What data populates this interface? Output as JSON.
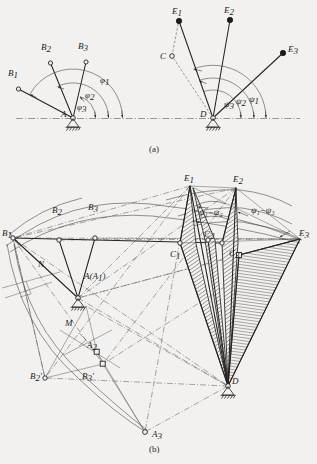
{
  "figure": {
    "panels": [
      {
        "id": "a",
        "caption": "(a)",
        "description": "Input crank AB and output crank DE angular positions"
      },
      {
        "id": "b",
        "caption": "(b)",
        "description": "Inversion construction with relative pole circles"
      }
    ]
  },
  "panel_a": {
    "caption": "(a)",
    "left_mechanism": {
      "pivot_label": "A",
      "points": [
        {
          "name": "B1",
          "label": "B",
          "sub": "1"
        },
        {
          "name": "B2",
          "label": "B",
          "sub": "2"
        },
        {
          "name": "B3",
          "label": "B",
          "sub": "3"
        }
      ],
      "angles": [
        {
          "name": "phi1",
          "label": "φ",
          "sub": "1"
        },
        {
          "name": "phi2",
          "label": "φ",
          "sub": "2"
        },
        {
          "name": "phi3",
          "label": "φ",
          "sub": "3"
        }
      ]
    },
    "right_mechanism": {
      "pivot_label": "D",
      "coupler_point_label": "C",
      "points": [
        {
          "name": "E1",
          "label": "E",
          "sub": "1"
        },
        {
          "name": "E2",
          "label": "E",
          "sub": "2"
        },
        {
          "name": "E3",
          "label": "E",
          "sub": "3"
        }
      ],
      "angles": [
        {
          "name": "psi1",
          "label": "ψ",
          "sub": "1"
        },
        {
          "name": "psi2",
          "label": "ψ",
          "sub": "2"
        },
        {
          "name": "psi3",
          "label": "ψ",
          "sub": "3"
        }
      ]
    }
  },
  "panel_b": {
    "caption": "(b)",
    "pivots": [
      {
        "name": "A",
        "label": "A(A",
        "sub": "1",
        "tail": ")"
      },
      {
        "name": "D",
        "label": "D",
        "sub": ""
      }
    ],
    "b_points": [
      {
        "name": "B1",
        "label": "B",
        "sub": "1"
      },
      {
        "name": "B2",
        "label": "B",
        "sub": "2"
      },
      {
        "name": "B3",
        "label": "B",
        "sub": "3"
      },
      {
        "name": "B2p",
        "label": "B",
        "sub": "2",
        "prime": "′"
      },
      {
        "name": "B3p",
        "label": "B",
        "sub": "3",
        "prime": "′"
      }
    ],
    "a_points": [
      {
        "name": "A2",
        "label": "A",
        "sub": "2"
      },
      {
        "name": "A3",
        "label": "A",
        "sub": "3"
      }
    ],
    "c_points": [
      {
        "name": "C1",
        "label": "C",
        "sub": "1"
      },
      {
        "name": "C2",
        "label": "C",
        "sub": "2"
      },
      {
        "name": "C3",
        "label": "C",
        "sub": "3"
      }
    ],
    "e_points": [
      {
        "name": "E1",
        "label": "E",
        "sub": "1"
      },
      {
        "name": "E2",
        "label": "E",
        "sub": "2"
      },
      {
        "name": "E3",
        "label": "E",
        "sub": "3"
      }
    ],
    "aux_points": [
      {
        "name": "M",
        "label": "M"
      },
      {
        "name": "N",
        "label": "N"
      }
    ],
    "angle_annotations": [
      {
        "name": "psi1-psi2",
        "text": "ψ₁−ψ₂"
      },
      {
        "name": "psi1-psi3",
        "text": "ψ₁−ψ₃"
      }
    ]
  },
  "colors": {
    "background": "#f2f1ef",
    "ink": "#1c1b1a",
    "line": "#3a3937",
    "construction": "#4a4947"
  }
}
